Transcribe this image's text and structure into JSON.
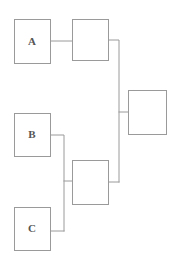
{
  "diagram": {
    "type": "block-diagram",
    "canvas": {
      "width": 174,
      "height": 261
    },
    "colors": {
      "background": "#ffffff",
      "box_stroke": "#9a9a9a",
      "box_fill": "#ffffff",
      "wire_stroke": "#9a9a9a",
      "label_text": "#555555"
    },
    "nodes": [
      {
        "id": "input-a",
        "label": "A",
        "x": 14,
        "y": 19,
        "width": 36,
        "height": 44,
        "has_label": true
      },
      {
        "id": "stage-top",
        "label": "",
        "x": 72,
        "y": 19,
        "width": 36,
        "height": 41,
        "has_label": false
      },
      {
        "id": "input-b",
        "label": "B",
        "x": 14,
        "y": 113,
        "width": 36,
        "height": 43,
        "has_label": true
      },
      {
        "id": "stage-output",
        "label": "",
        "x": 128,
        "y": 90,
        "width": 38,
        "height": 44,
        "has_label": false
      },
      {
        "id": "stage-bottom",
        "label": "",
        "x": 72,
        "y": 160,
        "width": 36,
        "height": 44,
        "has_label": false
      },
      {
        "id": "input-c",
        "label": "C",
        "x": 14,
        "y": 207,
        "width": 36,
        "height": 43,
        "has_label": true
      }
    ],
    "wires": [
      {
        "id": "wire-a-to-stage-top",
        "points": "50,41 72,41"
      },
      {
        "id": "wire-stage-top-to-trunk",
        "points": "108,40 119,40 119,182"
      },
      {
        "id": "wire-trunk-to-stage-output",
        "points": "119,112 128,112"
      },
      {
        "id": "wire-b-to-junction",
        "points": "50,135 64,135 64,231"
      },
      {
        "id": "wire-c-to-junction",
        "points": "50,231 64,231"
      },
      {
        "id": "wire-junction-to-stage-bottom",
        "points": "64,181 72,181"
      },
      {
        "id": "wire-stage-bottom-to-trunk",
        "points": "108,182 119,182"
      }
    ]
  }
}
